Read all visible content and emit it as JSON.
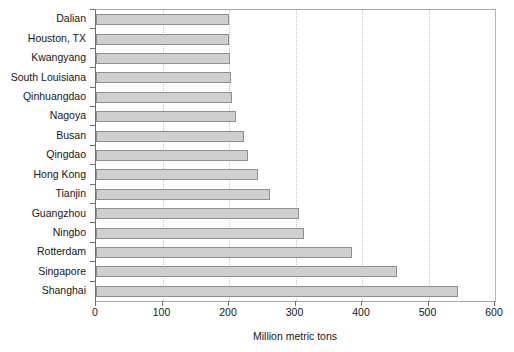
{
  "chart_data": {
    "type": "bar",
    "orientation": "horizontal",
    "title": "",
    "xlabel": "Million metric tons",
    "ylabel": "",
    "xlim": [
      0,
      600
    ],
    "xticks": [
      0,
      100,
      200,
      300,
      400,
      500,
      600
    ],
    "grid": "vertical-dotted",
    "legend": "none",
    "categories": [
      "Dalian",
      "Houston, TX",
      "Kwangyang",
      "South Louisiana",
      "Qinhuangdao",
      "Nagoya",
      "Busan",
      "Qingdao",
      "Hong Kong",
      "Tianjin",
      "Guangzhou",
      "Ningbo",
      "Rotterdam",
      "Singapore",
      "Shanghai"
    ],
    "values": [
      200,
      200,
      202,
      203,
      205,
      210,
      222,
      228,
      243,
      261,
      306,
      313,
      385,
      452,
      544
    ],
    "bar_color": "#cfcfcf",
    "bar_border_color": "#8f8f8f"
  },
  "axis": {
    "x_tick_labels": [
      "0",
      "100",
      "200",
      "300",
      "400",
      "500",
      "600"
    ],
    "x_title": "Million metric tons"
  },
  "colors": {
    "bar_fill": "#cfcfcf",
    "bar_stroke": "#8f8f8f",
    "grid": "#c0c0c0",
    "axis": "#6e6e6e",
    "plot_border": "#a8a8a8",
    "text": "#161616",
    "background": "#ffffff"
  }
}
